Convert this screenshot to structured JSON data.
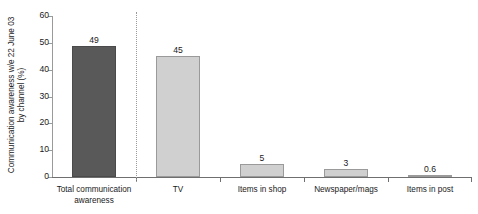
{
  "chart_data": {
    "type": "bar",
    "title": "",
    "xlabel": "",
    "ylabel": "Communication awareness w/e 22 June 03 by channel (%)",
    "ylabel_lines": [
      "Communication awareness w/e 22 June 03",
      "by channel (%)"
    ],
    "categories": [
      "Total communication awareness",
      "TV",
      "Items in shop",
      "Newspaper/mags",
      "Items in post"
    ],
    "category_lines": [
      [
        "Total communication",
        "awareness"
      ],
      [
        "TV"
      ],
      [
        "Items in shop"
      ],
      [
        "Newspaper/mags"
      ],
      [
        "Items in post"
      ]
    ],
    "values": [
      49,
      45,
      5,
      3,
      0.6
    ],
    "value_labels": [
      "49",
      "45",
      "5",
      "3",
      "0.6"
    ],
    "ylim": [
      0,
      60
    ],
    "yticks": [
      0,
      10,
      20,
      30,
      40,
      50,
      60
    ],
    "ytick_labels": [
      "0",
      "10",
      "20",
      "30",
      "40",
      "50",
      "60"
    ],
    "grid": false,
    "legend": "none",
    "bar_colors": [
      "#595959",
      "#d0d0d0",
      "#d0d0d0",
      "#d0d0d0",
      "#d0d0d0"
    ],
    "divider_after_category_index": 0,
    "divider_style": "dotted",
    "axis_color": "#6f6f6f",
    "text_color": "#1a1a1a",
    "background": "#ffffff"
  }
}
